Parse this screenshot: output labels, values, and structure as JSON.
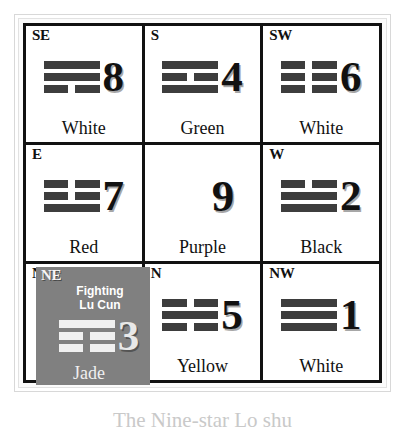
{
  "chart": {
    "caption": "The Nine-star Lo shu",
    "highlight_color": "#808080"
  },
  "palaces": [
    {
      "direction": "SE",
      "number": "8",
      "color_name": "White",
      "trigram": [
        "solid",
        "solid",
        "broken"
      ]
    },
    {
      "direction": "S",
      "number": "4",
      "color_name": "Green",
      "trigram": [
        "solid",
        "broken",
        "solid"
      ]
    },
    {
      "direction": "SW",
      "number": "6",
      "color_name": "White",
      "trigram": [
        "broken",
        "broken",
        "broken"
      ]
    },
    {
      "direction": "E",
      "number": "7",
      "color_name": "Red",
      "trigram": [
        "broken",
        "broken",
        "solid"
      ]
    },
    {
      "direction": "",
      "number": "9",
      "color_name": "Purple",
      "trigram": []
    },
    {
      "direction": "W",
      "number": "2",
      "color_name": "Black",
      "trigram": [
        "broken",
        "solid",
        "solid"
      ]
    },
    {
      "direction": "NE",
      "number": "3",
      "color_name": "Jade",
      "trigram": [
        "solid",
        "broken",
        "broken"
      ]
    },
    {
      "direction": "N",
      "number": "5",
      "color_name": "Yellow",
      "trigram": [
        "broken",
        "solid",
        "broken"
      ]
    },
    {
      "direction": "NW",
      "number": "1",
      "color_name": "White",
      "trigram": [
        "solid",
        "solid",
        "solid"
      ]
    }
  ],
  "highlight": {
    "direction": "NE",
    "annotation_line1": "Fighting",
    "annotation_line2": "Lu Cun",
    "number": "3",
    "color_name": "Jade"
  }
}
